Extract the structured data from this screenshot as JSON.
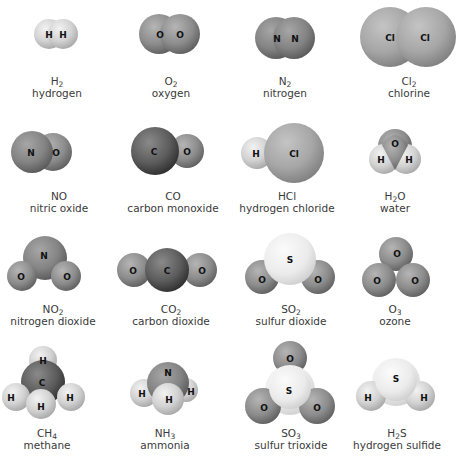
{
  "figure": {
    "molecules": [
      {
        "id": "h2",
        "formula": "H",
        "sub": "2",
        "tail": "",
        "name": "hydrogen"
      },
      {
        "id": "o2",
        "formula": "O",
        "sub": "2",
        "tail": "",
        "name": "oxygen"
      },
      {
        "id": "n2",
        "formula": "N",
        "sub": "2",
        "tail": "",
        "name": "nitrogen"
      },
      {
        "id": "cl2",
        "formula": "Cl",
        "sub": "2",
        "tail": "",
        "name": "chlorine"
      },
      {
        "id": "no",
        "formula": "NO",
        "sub": "",
        "tail": "",
        "name": "nitric oxide"
      },
      {
        "id": "co",
        "formula": "CO",
        "sub": "",
        "tail": "",
        "name": "carbon monoxide"
      },
      {
        "id": "hcl",
        "formula": "HCl",
        "sub": "",
        "tail": "",
        "name": "hydrogen chloride"
      },
      {
        "id": "h2o",
        "formula": "H",
        "sub": "2",
        "tail": "O",
        "name": "water"
      },
      {
        "id": "no2",
        "formula": "NO",
        "sub": "2",
        "tail": "",
        "name": "nitrogen dioxide"
      },
      {
        "id": "co2",
        "formula": "CO",
        "sub": "2",
        "tail": "",
        "name": "carbon dioxide"
      },
      {
        "id": "so2",
        "formula": "SO",
        "sub": "2",
        "tail": "",
        "name": "sulfur dioxide"
      },
      {
        "id": "o3",
        "formula": "O",
        "sub": "3",
        "tail": "",
        "name": "ozone"
      },
      {
        "id": "ch4",
        "formula": "CH",
        "sub": "4",
        "tail": "",
        "name": "methane"
      },
      {
        "id": "nh3",
        "formula": "NH",
        "sub": "3",
        "tail": "",
        "name": "ammonia"
      },
      {
        "id": "so3",
        "formula": "SO",
        "sub": "3",
        "tail": "",
        "name": "sulfur trioxide"
      },
      {
        "id": "h2s",
        "formula": "H",
        "sub": "2",
        "tail": "S",
        "name": "hydrogen sulfide"
      }
    ],
    "atom_labels": {
      "H": "H",
      "O": "O",
      "N": "N",
      "Cl": "Cl",
      "C": "C",
      "S": "S"
    },
    "colors": {
      "hydrogen": "#d9d9d9",
      "oxygen": "#8e8e8e",
      "nitrogen": "#7f7f7f",
      "chlorine": "#a8a8a8",
      "carbon": "#5a5a5a",
      "sulfur": "#ececec",
      "label_text": "#3a3a3a"
    }
  }
}
